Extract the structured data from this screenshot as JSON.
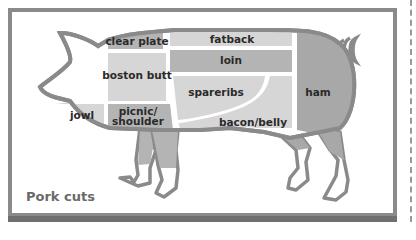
{
  "caption": "Pork cuts",
  "colors": {
    "outline": "#8a8a8a",
    "frame": "#8a8a8a",
    "light_cut": "#d6d6d6",
    "medium_cut": "#b4b4b4",
    "dark_cut": "#a8a8a8",
    "text": "#2a2a2a",
    "caption": "#6a6a6a"
  },
  "cuts": [
    {
      "id": "clear-plate",
      "label": "clear plate",
      "shade": "medium"
    },
    {
      "id": "fatback",
      "label": "fatback",
      "shade": "light"
    },
    {
      "id": "loin",
      "label": "loin",
      "shade": "medium"
    },
    {
      "id": "boston-butt",
      "label": "boston butt",
      "shade": "light"
    },
    {
      "id": "spareribs",
      "label": "spareribs",
      "shade": "light"
    },
    {
      "id": "ham",
      "label": "ham",
      "shade": "dark"
    },
    {
      "id": "jowl",
      "label": "jowl",
      "shade": "light"
    },
    {
      "id": "picnic-shoulder",
      "label_line1": "picnic/",
      "label_line2": "shoulder",
      "shade": "medium"
    },
    {
      "id": "bacon-belly",
      "label": "bacon/belly",
      "shade": "light"
    }
  ]
}
